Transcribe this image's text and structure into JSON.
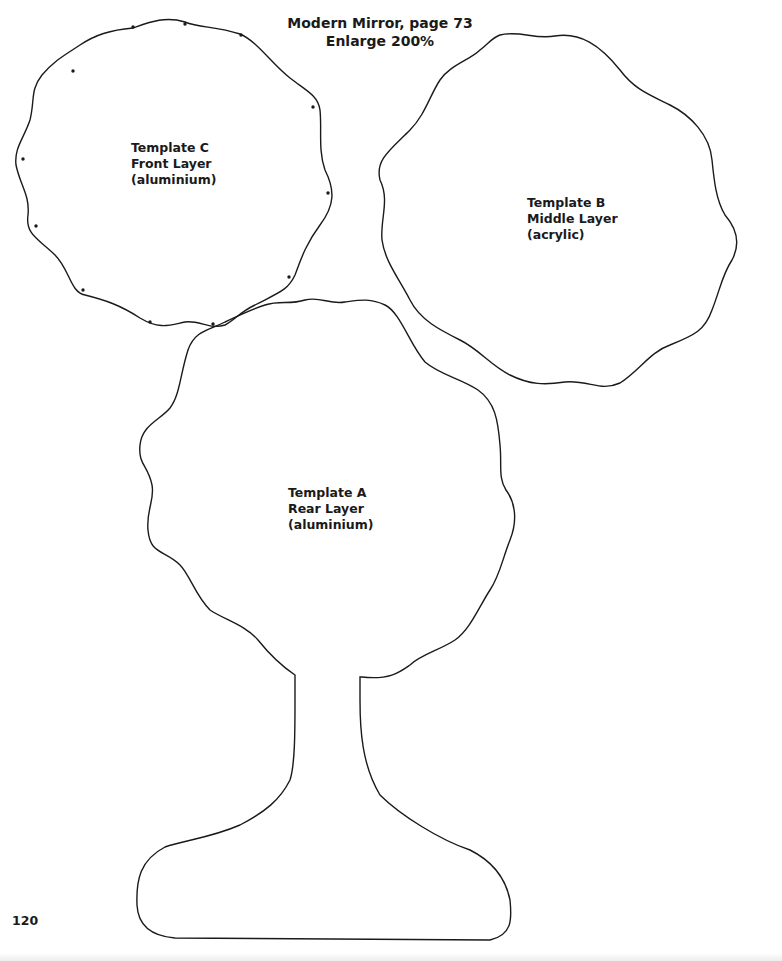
{
  "header": {
    "title_line1": "Modern Mirror, page 73",
    "title_line2": "Enlarge 200%"
  },
  "templates": [
    {
      "id": "C",
      "name": "Template C",
      "layer": "Front Layer",
      "material": "(aluminium)",
      "drill_holes": 12
    },
    {
      "id": "B",
      "name": "Template B",
      "layer": "Middle Layer",
      "material": "(acrylic)"
    },
    {
      "id": "A",
      "name": "Template A",
      "layer": "Rear Layer",
      "material": "(aluminium)"
    }
  ],
  "footer": {
    "page_number": "120"
  },
  "colors": {
    "outline": "#1a1a1a",
    "background": "#ffffff"
  }
}
